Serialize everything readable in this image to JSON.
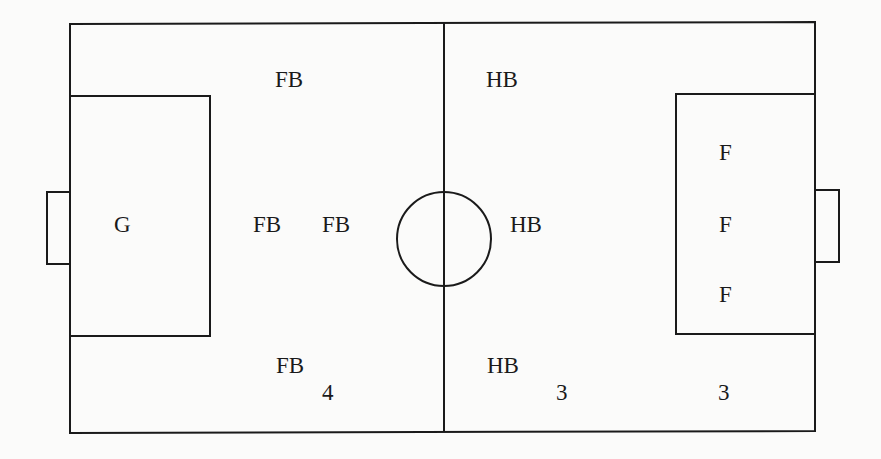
{
  "diagram": {
    "type": "soccer-field-formation",
    "line_color": "#1a1a1a",
    "background": "#fbfbfa",
    "positions": {
      "goalkeeper": "G",
      "fullback_top": "FB",
      "fullback_center_1": "FB",
      "fullback_center_2": "FB",
      "fullback_bottom": "FB",
      "halfback_top": "HB",
      "halfback_center": "HB",
      "halfback_bottom": "HB",
      "forward_top": "F",
      "forward_center": "F",
      "forward_bottom": "F"
    },
    "counts": {
      "fullbacks": "4",
      "halfbacks": "3",
      "forwards": "3"
    }
  }
}
